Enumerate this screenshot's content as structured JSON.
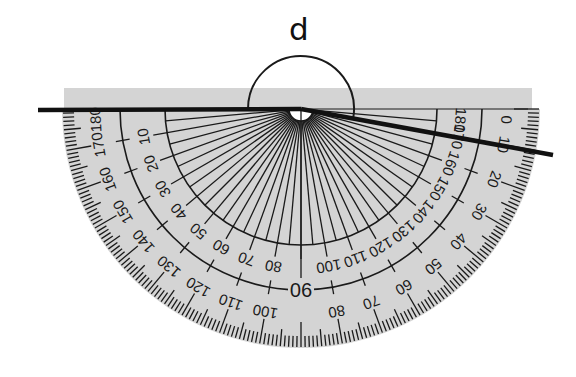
{
  "diagram": {
    "angle_label": "d",
    "colors": {
      "background": "#ffffff",
      "protractor_fill": "#d4d4d4",
      "ink": "#1a1a1a",
      "arm": "#111111"
    },
    "protractor": {
      "center": [
        301,
        109
      ],
      "outer_radius": 239,
      "top_bar": {
        "x1": 64,
        "x2": 532,
        "y_top": 88
      },
      "inner_arc_radius": 136,
      "middle_arc_radius": 181,
      "hub_radius": 12,
      "inner_scale_labels": {
        "radius": 160,
        "comment_order": "left baseline to right baseline",
        "values": [
          "0",
          "10",
          "20",
          "30",
          "40",
          "50",
          "60",
          "70",
          "80",
          "90",
          "100",
          "110",
          "120",
          "130",
          "140",
          "150",
          "160",
          "170",
          "180"
        ],
        "show_at_degrees": [
          10,
          20,
          30,
          40,
          50,
          60,
          70,
          80,
          100,
          110,
          120,
          130,
          140,
          150,
          160,
          170,
          180
        ]
      },
      "outer_scale_labels": {
        "radius": 206,
        "values": [
          "180",
          "170",
          "160",
          "150",
          "140",
          "130",
          "120",
          "110",
          "100",
          "90",
          "80",
          "70",
          "60",
          "50",
          "40",
          "30",
          "20",
          "10",
          "0"
        ],
        "show_at_degrees": [
          0,
          10,
          20,
          30,
          40,
          50,
          60,
          70,
          80,
          100,
          110,
          120,
          130,
          140,
          150,
          160,
          170,
          180
        ]
      },
      "center_label": "90"
    },
    "arms": {
      "left": {
        "from": [
          38,
          110
        ],
        "to": [
          301,
          109
        ]
      },
      "right": {
        "from": [
          301,
          109
        ],
        "to": [
          553,
          155
        ]
      }
    },
    "angle_arc": {
      "radius": 53,
      "start_deg": 180,
      "end_deg": 349.7
    }
  }
}
